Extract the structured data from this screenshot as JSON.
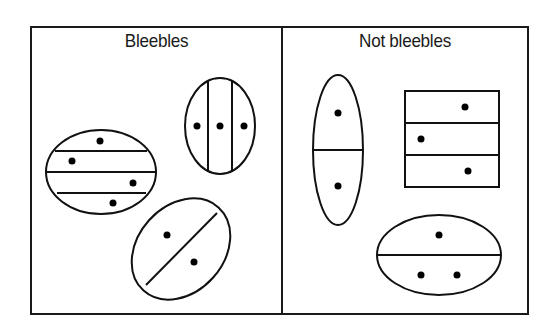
{
  "diagram": {
    "panels": [
      {
        "id": "left",
        "title": "Bleebles"
      },
      {
        "id": "right",
        "title": "Not bleebles"
      }
    ],
    "shapes": {
      "bleebles": [
        {
          "kind": "ellipse",
          "divisions": "horizontal",
          "sections": 4,
          "dots": 4
        },
        {
          "kind": "ellipse",
          "divisions": "vertical",
          "sections": 3,
          "dots": 3
        },
        {
          "kind": "ellipse",
          "divisions": "diagonal",
          "sections": 2,
          "dots": 2
        }
      ],
      "not_bleebles": [
        {
          "kind": "ellipse",
          "divisions": "horizontal",
          "sections": 2,
          "dots": 2
        },
        {
          "kind": "rectangle",
          "divisions": "horizontal",
          "sections": 3,
          "dots": 3
        },
        {
          "kind": "ellipse",
          "divisions": "horizontal",
          "sections": 2,
          "dots": 3
        }
      ]
    },
    "colors": {
      "line": "#111111",
      "background": "#ffffff"
    }
  }
}
